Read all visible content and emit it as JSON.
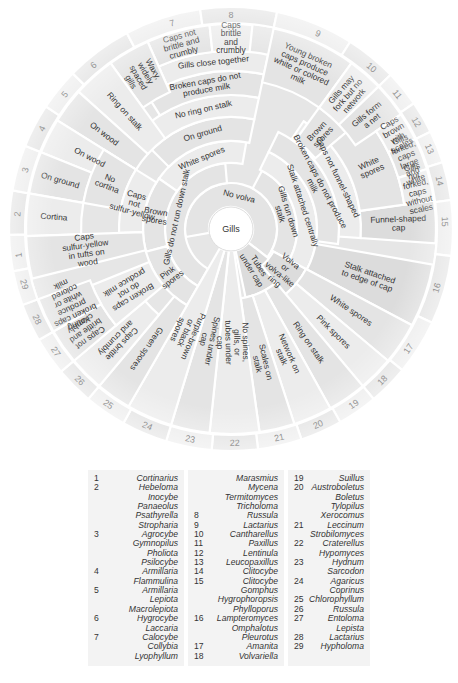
{
  "center": "Gills",
  "segments": [
    {
      "id": "no-volva",
      "label": "No volva"
    },
    {
      "id": "gills-run-down",
      "label": "Gills run down stalk"
    },
    {
      "id": "gills-not-run-down",
      "label": "Gills do not run down stalk"
    },
    {
      "id": "tubes-under-cap",
      "label": "Tubes under cap"
    },
    {
      "id": "volva-ring",
      "label": "Volva or volva-like ring"
    },
    {
      "id": "stalk-central",
      "label": "Stalk attached centrally"
    },
    {
      "id": "stalk-edge",
      "label": "Stalk attached to edge of cap"
    },
    {
      "id": "white-spores-inner",
      "label": "White spores"
    },
    {
      "id": "brown-spores-left",
      "label": "Brown spores"
    },
    {
      "id": "pink-spores-left",
      "label": "Pink spores"
    },
    {
      "id": "on-ground-upper",
      "label": "On ground"
    },
    {
      "id": "no-ring",
      "label": "No ring on stalk"
    },
    {
      "id": "broken-no-milk-upper",
      "label": "Broken caps do not produce milk"
    },
    {
      "id": "gills-close",
      "label": "Gills close together"
    },
    {
      "id": "caps-not-brittle-7",
      "label": "Caps not brittle and crumbly"
    },
    {
      "id": "caps-brittle-8",
      "label": "Caps brittle and crumbly"
    },
    {
      "id": "waxy-gills",
      "label": "Waxy, widely spaced gills"
    },
    {
      "id": "ring-on-stalk-5",
      "label": "Ring on stalk"
    },
    {
      "id": "on-wood-4",
      "label": "On wood"
    },
    {
      "id": "on-wood-3",
      "label": "On wood"
    },
    {
      "id": "on-ground-2",
      "label": "On ground"
    },
    {
      "id": "no-cortina",
      "label": "No cortina"
    },
    {
      "id": "cortina",
      "label": "Cortina"
    },
    {
      "id": "caps-not-sulfur",
      "label": "Caps not sulfur-yellow"
    },
    {
      "id": "caps-sulfur",
      "label": "Caps sulfur-yellow in tufts on wood"
    },
    {
      "id": "young-broken-9",
      "label": "Young broken caps produce white or colored milk"
    },
    {
      "id": "broken-no-milk-right",
      "label": "Broken caps do not produce milk"
    },
    {
      "id": "caps-not-funnel",
      "label": "Caps not funnel-shaped"
    },
    {
      "id": "funnel-cap",
      "label": "Funnel-shaped cap"
    },
    {
      "id": "brown-spores-right",
      "label": "Brown spores"
    },
    {
      "id": "white-spores-right",
      "label": "White spores"
    },
    {
      "id": "gills-fork",
      "label": "Gills may fork but no network"
    },
    {
      "id": "gills-net",
      "label": "Gills form a net"
    },
    {
      "id": "caps-brown-scales",
      "label": "Caps brown with scales"
    },
    {
      "id": "gills-forked-large",
      "label": "Gills forked, caps large and white"
    },
    {
      "id": "gills-not-forked",
      "label": "Gills not forked, caps without scales"
    },
    {
      "id": "white-spores-17",
      "label": "White spores"
    },
    {
      "id": "pink-spores-18",
      "label": "Pink spores"
    },
    {
      "id": "ring-on-stalk-19",
      "label": "Ring on stalk"
    },
    {
      "id": "network-on-stalk",
      "label": "Network on stalk"
    },
    {
      "id": "scales-on-stalk",
      "label": "Scales on stalk"
    },
    {
      "id": "no-spines",
      "label": "No spines, gills, or tubes under cap"
    },
    {
      "id": "spines-under-cap",
      "label": "Spines under cap"
    },
    {
      "id": "purple-brown",
      "label": "Purple-brown or black spores"
    },
    {
      "id": "green-spores",
      "label": "Green spores"
    },
    {
      "id": "caps-brittle-26",
      "label": "Caps brittle and crumbly"
    },
    {
      "id": "caps-not-brittle-27",
      "label": "Caps not brittle and crumbly"
    },
    {
      "id": "broken-no-milk-left",
      "label": "Broken caps do not produce milk"
    },
    {
      "id": "young-broken-28",
      "label": "Young broken caps produce white or colored milk"
    }
  ],
  "numbers": [
    "1",
    "2",
    "3",
    "4",
    "5",
    "6",
    "7",
    "8",
    "9",
    "10",
    "11",
    "12",
    "13",
    "14",
    "15",
    "16",
    "17",
    "18",
    "19",
    "20",
    "21",
    "22",
    "23",
    "24",
    "25",
    "26",
    "27",
    "28",
    "29"
  ],
  "legend": {
    "columns": [
      [
        {
          "num": "1",
          "genus": "Cortinarius"
        },
        {
          "num": "2",
          "genus": "Hebeloma"
        },
        {
          "num": "",
          "genus": "Inocybe"
        },
        {
          "num": "",
          "genus": "Panaeolus"
        },
        {
          "num": "",
          "genus": "Psathyrella"
        },
        {
          "num": "",
          "genus": "Stropharia"
        },
        {
          "num": "3",
          "genus": "Agrocybe"
        },
        {
          "num": "",
          "genus": "Gymnopilus"
        },
        {
          "num": "",
          "genus": "Pholiota"
        },
        {
          "num": "",
          "genus": "Psilocybe"
        },
        {
          "num": "4",
          "genus": "Armillaria"
        },
        {
          "num": "",
          "genus": "Flammulina"
        },
        {
          "num": "5",
          "genus": "Armillaria"
        },
        {
          "num": "",
          "genus": "Lepiota"
        },
        {
          "num": "",
          "genus": "Macrolepiota"
        },
        {
          "num": "6",
          "genus": "Hygrocybe"
        },
        {
          "num": "",
          "genus": "Laccaria"
        },
        {
          "num": "7",
          "genus": "Calocybe"
        },
        {
          "num": "",
          "genus": "Collybia"
        },
        {
          "num": "",
          "genus": "Lyophyllum"
        }
      ],
      [
        {
          "num": "",
          "genus": "Marasmius"
        },
        {
          "num": "",
          "genus": "Mycena"
        },
        {
          "num": "",
          "genus": "Termitomyces"
        },
        {
          "num": "",
          "genus": "Tricholoma"
        },
        {
          "num": "8",
          "genus": "Russula"
        },
        {
          "num": "9",
          "genus": "Lactarius"
        },
        {
          "num": "10",
          "genus": "Cantharellus"
        },
        {
          "num": "11",
          "genus": "Paxillus"
        },
        {
          "num": "12",
          "genus": "Lentinula"
        },
        {
          "num": "13",
          "genus": "Leucopaxillus"
        },
        {
          "num": "14",
          "genus": "Clitocybe"
        },
        {
          "num": "15",
          "genus": "Clitocybe"
        },
        {
          "num": "",
          "genus": "Gomphus"
        },
        {
          "num": "",
          "genus": "Hygrophoropsis"
        },
        {
          "num": "",
          "genus": "Phylloporus"
        },
        {
          "num": "16",
          "genus": "Lampteromyces"
        },
        {
          "num": "",
          "genus": "Omphalotus"
        },
        {
          "num": "",
          "genus": "Pleurotus"
        },
        {
          "num": "17",
          "genus": "Amanita"
        },
        {
          "num": "18",
          "genus": "Volvariella"
        }
      ],
      [
        {
          "num": "19",
          "genus": "Suillus"
        },
        {
          "num": "20",
          "genus": "Austroboletus"
        },
        {
          "num": "",
          "genus": "Boletus"
        },
        {
          "num": "",
          "genus": "Tylopilus"
        },
        {
          "num": "",
          "genus": "Xerocomus"
        },
        {
          "num": "21",
          "genus": "Leccinum"
        },
        {
          "num": "",
          "genus": "Strobilomyces"
        },
        {
          "num": "22",
          "genus": "Craterellus"
        },
        {
          "num": "",
          "genus": "Hypomyces"
        },
        {
          "num": "23",
          "genus": "Hydnum"
        },
        {
          "num": "",
          "genus": "Sarcodon"
        },
        {
          "num": "24",
          "genus": "Agaricus"
        },
        {
          "num": "",
          "genus": "Coprinus"
        },
        {
          "num": "25",
          "genus": "Chlorophyllum"
        },
        {
          "num": "26",
          "genus": "Russula"
        },
        {
          "num": "27",
          "genus": "Entoloma"
        },
        {
          "num": "",
          "genus": "Lepista"
        },
        {
          "num": "28",
          "genus": "Lactarius"
        },
        {
          "num": "29",
          "genus": "Hypholoma"
        }
      ]
    ]
  }
}
